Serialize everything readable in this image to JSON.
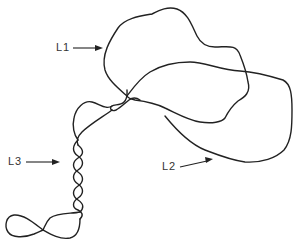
{
  "diagram": {
    "stroke_color": "#222222",
    "background_color": "#ffffff",
    "labels": [
      {
        "id": "L1",
        "text": "L1",
        "target": "upper loop"
      },
      {
        "id": "L2",
        "text": "L2",
        "target": "right large loop"
      },
      {
        "id": "L3",
        "text": "L3",
        "target": "twisted supercoiled strand"
      }
    ]
  }
}
